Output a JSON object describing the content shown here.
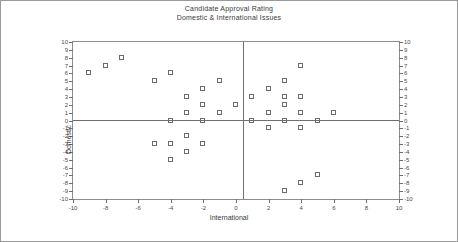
{
  "chart_data": {
    "type": "scatter",
    "title": "Candidate Approval Rating",
    "subtitle": "Domestic & International Issues",
    "xlabel": "International",
    "ylabel": "Domestic",
    "xlim": [
      -10,
      10
    ],
    "ylim": [
      -10,
      10
    ],
    "grid": false,
    "legend": null,
    "xticks": [
      -10,
      -8,
      -6,
      -4,
      -2,
      0,
      2,
      4,
      6,
      8,
      10
    ],
    "xticklabels": [
      "-10",
      "-8",
      "-6",
      "-4",
      "-2",
      "0",
      "2",
      "4",
      "6",
      "8",
      "10"
    ],
    "yticks": [
      10,
      9,
      8,
      7,
      6,
      5,
      4,
      3,
      2,
      1,
      0,
      -1,
      -2,
      -3,
      -4,
      -5,
      -6,
      -7,
      -8,
      -9,
      -10
    ],
    "yticklabels": [
      "10",
      "9",
      "8",
      "7",
      "6",
      "5",
      "4",
      "3",
      "2",
      "1",
      "0",
      "-1",
      "-2",
      "-3",
      "-4",
      "-5",
      "-6",
      "-7",
      "-8",
      "-9",
      "-10"
    ],
    "right_axis_ticks": [
      10,
      9,
      8,
      7,
      6,
      5,
      4,
      3,
      2,
      1,
      0,
      -1,
      -2,
      -3,
      -4,
      -5,
      -6,
      -7,
      -8,
      -9,
      -10
    ],
    "right_axis_ticklabels": [
      "10",
      "9",
      "8",
      "7",
      "6",
      "5",
      "4",
      "3",
      "2",
      "1",
      "0",
      "-1",
      "-2",
      "-3",
      "-4",
      "-5",
      "-6",
      "-7",
      "-8",
      "-9",
      "-10"
    ],
    "marker_style": "open-square",
    "marker_color": "#6b6b6b",
    "points": [
      {
        "x": -9,
        "y": 6
      },
      {
        "x": -8,
        "y": 7
      },
      {
        "x": -7,
        "y": 8
      },
      {
        "x": -5,
        "y": 5
      },
      {
        "x": -4,
        "y": 6
      },
      {
        "x": -3,
        "y": 3
      },
      {
        "x": -3,
        "y": 1
      },
      {
        "x": -3,
        "y": -2
      },
      {
        "x": -3,
        "y": -4
      },
      {
        "x": -2,
        "y": 4
      },
      {
        "x": -2,
        "y": 2
      },
      {
        "x": -2,
        "y": 0
      },
      {
        "x": -2,
        "y": -3
      },
      {
        "x": -4,
        "y": 0
      },
      {
        "x": -4,
        "y": -5
      },
      {
        "x": -4,
        "y": -3
      },
      {
        "x": -5,
        "y": -3
      },
      {
        "x": -1,
        "y": 5
      },
      {
        "x": -1,
        "y": 1
      },
      {
        "x": 0,
        "y": 2
      },
      {
        "x": 1,
        "y": 3
      },
      {
        "x": 1,
        "y": 0
      },
      {
        "x": 2,
        "y": 4
      },
      {
        "x": 2,
        "y": 1
      },
      {
        "x": 2,
        "y": -1
      },
      {
        "x": 3,
        "y": 5
      },
      {
        "x": 3,
        "y": 3
      },
      {
        "x": 3,
        "y": 2
      },
      {
        "x": 3,
        "y": 0
      },
      {
        "x": 3,
        "y": -9
      },
      {
        "x": 4,
        "y": 7
      },
      {
        "x": 4,
        "y": 3
      },
      {
        "x": 4,
        "y": 1
      },
      {
        "x": 4,
        "y": -1
      },
      {
        "x": 4,
        "y": -8
      },
      {
        "x": 5,
        "y": 0
      },
      {
        "x": 5,
        "y": -7
      },
      {
        "x": 6,
        "y": 1
      }
    ]
  }
}
